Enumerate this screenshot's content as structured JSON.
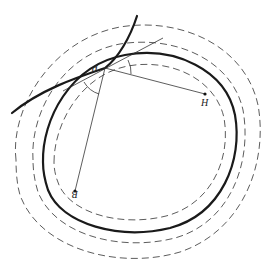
{
  "diagram": {
    "type": "geometric-figure",
    "colors": {
      "stroke": "#1a1a1a",
      "dashed": "#4a4a4a",
      "background": "#ffffff"
    },
    "labels": {
      "p": "P",
      "h": "H",
      "b": "B"
    },
    "points": {
      "P": [
        105,
        68
      ],
      "H": [
        205,
        94
      ],
      "B": [
        75,
        191
      ]
    },
    "elements": [
      "thick closed oval curve",
      "two inner/outer dashed offset curves near oval",
      "outermost dashed offset curve",
      "thick crossing curve through P",
      "thin tangent line through P",
      "segment P–H",
      "segment P–B",
      "angle arcs at P"
    ]
  }
}
